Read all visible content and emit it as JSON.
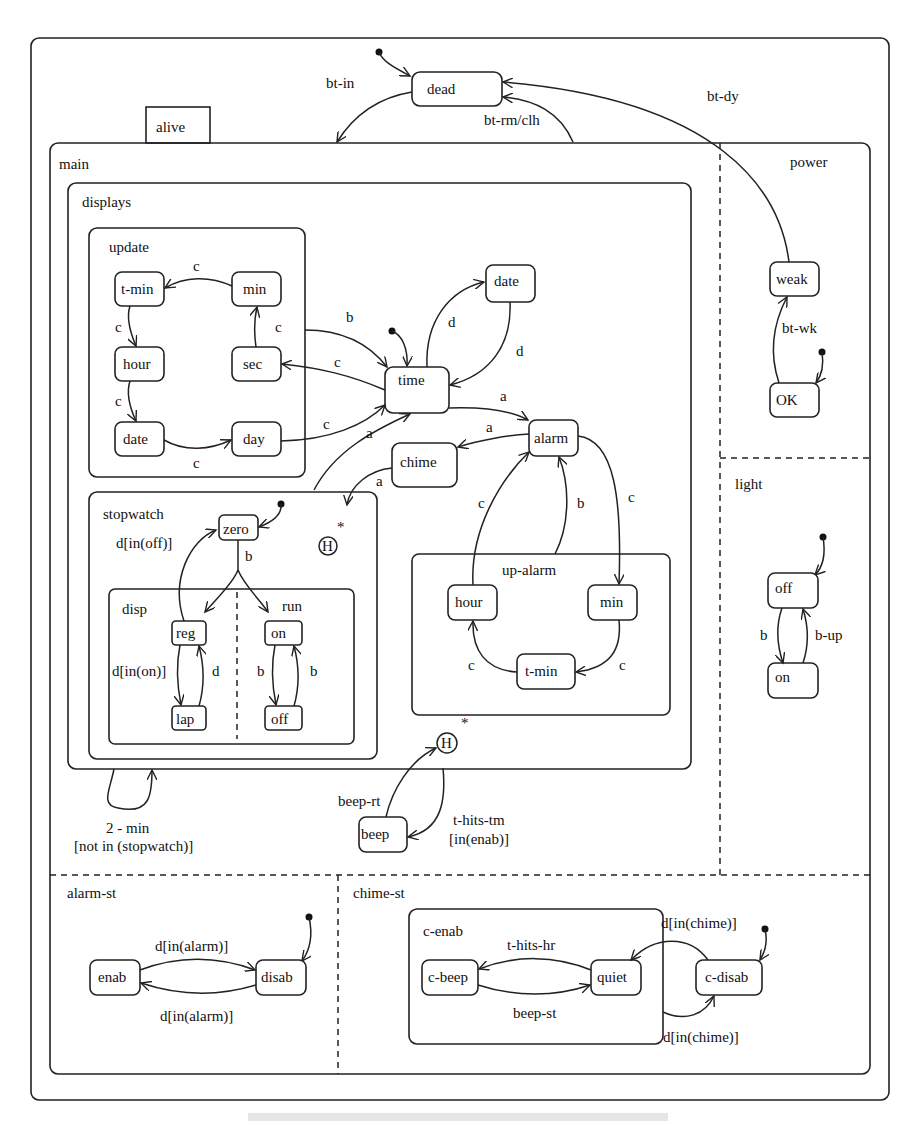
{
  "diagram": {
    "type": "statechart",
    "outer": {
      "label": ""
    },
    "top_states": {
      "dead": "dead",
      "alive_tab": "alive"
    },
    "top_transitions": {
      "bt_in": "bt-in",
      "bt_dy": "bt-dy",
      "bt_rm": "bt-rm/clh"
    },
    "main": {
      "label": "main",
      "displays": {
        "label": "displays",
        "update": {
          "label": "update",
          "states": {
            "t_min": "t-min",
            "min": "min",
            "hour": "hour",
            "sec": "sec",
            "date": "date",
            "day": "day"
          },
          "edges": {
            "min_tmin": "c",
            "tmin_hour": "c",
            "hour_date": "c",
            "sec_min": "c",
            "date_day": "c"
          }
        },
        "states": {
          "time": "time",
          "date": "date",
          "alarm": "alarm",
          "chime": "chime"
        },
        "edges": {
          "update_time": "b",
          "time_sec": "c",
          "day_time": "c",
          "stopwatch_time": "a",
          "time_date": "d",
          "date_time": "d",
          "time_alarm": "a",
          "alarm_chime": "a",
          "chime_hist": "a",
          "hour_alarm": "c",
          "up_alarm_b": "b",
          "alarm_min": "c"
        },
        "history": {
          "symbol": "H",
          "star": "*"
        },
        "stopwatch": {
          "label": "stopwatch",
          "zero": "zero",
          "edge_zero_b": "b",
          "edge_reg_zero": "d[in(off)]",
          "disp": {
            "label": "disp",
            "states": {
              "reg": "reg",
              "lap": "lap"
            },
            "edges": {
              "reg_lap": "d[in(on)]",
              "lap_reg": "d"
            }
          },
          "run": {
            "label": "run",
            "states": {
              "on": "on",
              "off": "off"
            },
            "edges": {
              "on_off": "b",
              "off_on": "b"
            }
          }
        },
        "up_alarm": {
          "label": "up-alarm",
          "states": {
            "hour": "hour",
            "min": "min",
            "t_min": "t-min"
          },
          "edges": {
            "min_tmin": "c",
            "tmin_hour": "c"
          }
        }
      },
      "displays_loop": {
        "line1": "2 - min",
        "line2": "[not in (stopwatch)]"
      },
      "beep": {
        "state": "beep",
        "history": {
          "symbol": "H",
          "star": "*"
        },
        "beep_rt": "beep-rt",
        "t_hits_tm_1": "t-hits-tm",
        "t_hits_tm_2": "[in(enab)]"
      },
      "power": {
        "label": "power",
        "states": {
          "weak": "weak",
          "ok": "OK"
        },
        "edges": {
          "ok_weak": "bt-wk"
        }
      },
      "light": {
        "label": "light",
        "states": {
          "off": "off",
          "on": "on"
        },
        "edges": {
          "off_on": "b",
          "on_off": "b-up"
        }
      },
      "alarm_st": {
        "label": "alarm-st",
        "states": {
          "enab": "enab",
          "disab": "disab"
        },
        "edges": {
          "enab_disab": "d[in(alarm)]",
          "disab_enab": "d[in(alarm)]"
        }
      },
      "chime_st": {
        "label": "chime-st",
        "c_enab": {
          "label": "c-enab",
          "states": {
            "c_beep": "c-beep",
            "quiet": "quiet"
          },
          "edges": {
            "quiet_cbeep": "t-hits-hr",
            "cbeep_quiet": "beep-st"
          }
        },
        "c_disab": "c-disab",
        "edges": {
          "cdisab_quiet": "d[in(chime)]",
          "cenab_cdisab": "d[in(chime)]"
        }
      }
    }
  }
}
